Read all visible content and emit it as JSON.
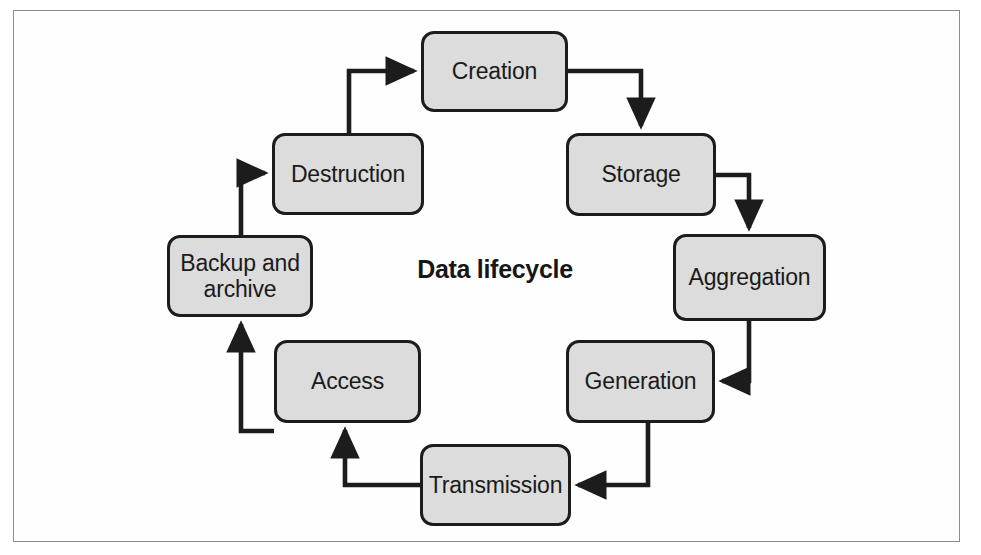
{
  "figure": {
    "title": "Data lifecycle",
    "frame": {
      "border_color": "#8d8d8d",
      "background": "#fefefe"
    },
    "style": {
      "node_fill": "#dcdcdc",
      "node_stroke": "#1c1c1c",
      "arrow_color": "#1c1c1c",
      "text_color": "#1a1a1a"
    }
  },
  "nodes": [
    {
      "id": "creation",
      "label": "Creation",
      "x": 421,
      "y": 31,
      "w": 147,
      "h": 81
    },
    {
      "id": "storage",
      "label": "Storage",
      "x": 566,
      "y": 133,
      "w": 150,
      "h": 83
    },
    {
      "id": "aggregation",
      "label": "Aggregation",
      "x": 673,
      "y": 234,
      "w": 153,
      "h": 87
    },
    {
      "id": "generation",
      "label": "Generation",
      "x": 566,
      "y": 340,
      "w": 149,
      "h": 83
    },
    {
      "id": "transmission",
      "label": "Transmission",
      "x": 420,
      "y": 444,
      "w": 151,
      "h": 82
    },
    {
      "id": "access",
      "label": "Access",
      "x": 274,
      "y": 340,
      "w": 147,
      "h": 83
    },
    {
      "id": "backup",
      "label": "Backup and\narchive",
      "x": 167,
      "y": 235,
      "w": 146,
      "h": 82
    },
    {
      "id": "destruction",
      "label": "Destruction",
      "x": 272,
      "y": 133,
      "w": 152,
      "h": 82
    }
  ],
  "edges": [
    {
      "id": "creation-to-storage",
      "from": "creation",
      "to": "storage"
    },
    {
      "id": "storage-to-aggregation",
      "from": "storage",
      "to": "aggregation"
    },
    {
      "id": "aggregation-to-generation",
      "from": "aggregation",
      "to": "generation"
    },
    {
      "id": "generation-to-transmission",
      "from": "generation",
      "to": "transmission"
    },
    {
      "id": "transmission-to-access",
      "from": "transmission",
      "to": "access"
    },
    {
      "id": "access-to-backup",
      "from": "access",
      "to": "backup"
    },
    {
      "id": "backup-to-destruction",
      "from": "backup",
      "to": "destruction"
    },
    {
      "id": "destruction-to-creation",
      "from": "destruction",
      "to": "creation"
    }
  ]
}
